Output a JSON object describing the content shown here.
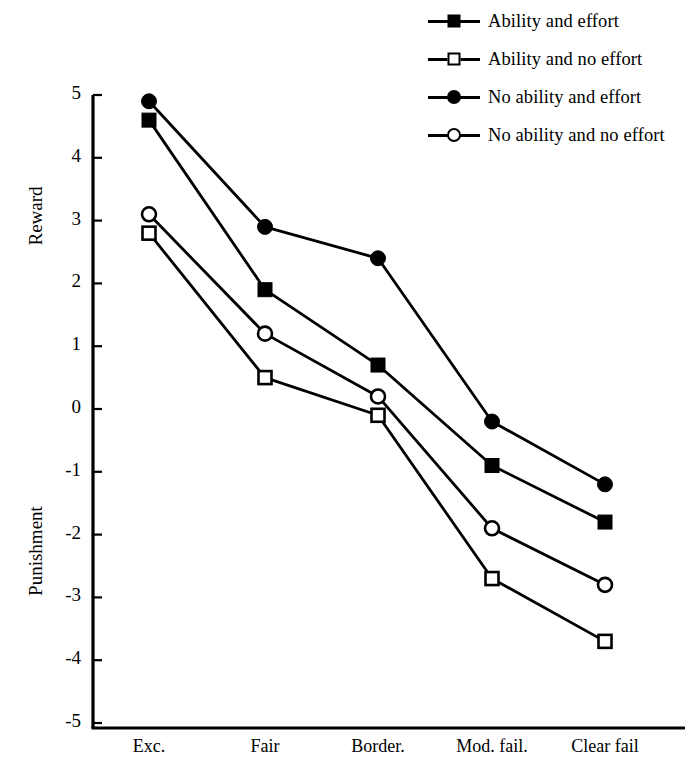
{
  "chart_data": {
    "type": "line",
    "title": "",
    "xlabel": "",
    "ylabel": "Reward / Punishment",
    "categories": [
      "Exc.",
      "Fair",
      "Border.",
      "Mod. fail.",
      "Clear fail"
    ],
    "ylim": [
      -5,
      5
    ],
    "yticks": [
      5,
      4,
      3,
      2,
      1,
      0,
      -1,
      -2,
      -3,
      -4,
      -5
    ],
    "ytick_labels": [
      "5",
      "4",
      "3",
      "2",
      "1",
      "0",
      "-1",
      "-2",
      "-3",
      "-4",
      "-5"
    ],
    "grid": false,
    "legend_position": "top-right",
    "axis_titles": {
      "upper": "Reward",
      "lower": "Punishment"
    },
    "series": [
      {
        "name": "Ability and effort",
        "marker": "filled-square",
        "color": "#000000",
        "values": [
          4.6,
          1.9,
          0.7,
          -0.9,
          -1.8
        ]
      },
      {
        "name": "Ability and no effort",
        "marker": "open-square",
        "color": "#000000",
        "values": [
          2.8,
          0.5,
          -0.1,
          -2.7,
          -3.7
        ]
      },
      {
        "name": "No ability and effort",
        "marker": "filled-circle",
        "color": "#000000",
        "values": [
          4.9,
          2.9,
          2.4,
          -0.2,
          -1.2
        ]
      },
      {
        "name": "No ability and no effort",
        "marker": "open-circle",
        "color": "#000000",
        "values": [
          3.1,
          1.2,
          0.2,
          -1.9,
          -2.8
        ]
      }
    ]
  },
  "legend": {
    "items": [
      {
        "label": "Ability and effort",
        "marker": "filled-square"
      },
      {
        "label": "Ability and no effort",
        "marker": "open-square"
      },
      {
        "label": "No ability and effort",
        "marker": "filled-circle"
      },
      {
        "label": "No ability and no effort",
        "marker": "open-circle"
      }
    ]
  }
}
